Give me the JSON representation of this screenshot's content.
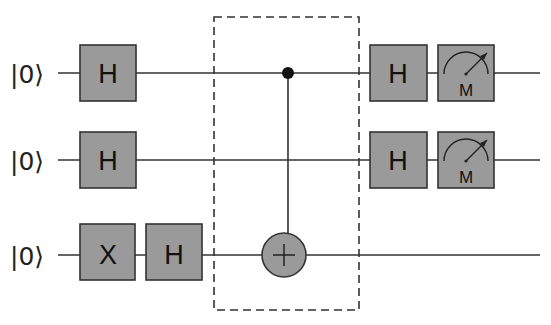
{
  "diagram": {
    "type": "quantum-circuit",
    "colors": {
      "wire": "#333333",
      "gate_fill": "#9a9a9a",
      "gate_stroke": "#333333",
      "dashed_box": "#333333",
      "control_dot": "#111111"
    },
    "qubits": [
      {
        "label": "|0⟩",
        "wire_y": 73
      },
      {
        "label": "|0⟩",
        "wire_y": 160
      },
      {
        "label": "|0⟩",
        "wire_y": 255
      }
    ],
    "gates": [
      {
        "qubit": 0,
        "label": "H",
        "type": "hadamard",
        "position": "pre"
      },
      {
        "qubit": 1,
        "label": "H",
        "type": "hadamard",
        "position": "pre"
      },
      {
        "qubit": 2,
        "label": "X",
        "type": "pauli-x",
        "position": "pre"
      },
      {
        "qubit": 2,
        "label": "H",
        "type": "hadamard",
        "position": "pre"
      },
      {
        "qubit": 0,
        "label": "H",
        "type": "hadamard",
        "position": "post"
      },
      {
        "qubit": 1,
        "label": "H",
        "type": "hadamard",
        "position": "post"
      },
      {
        "qubit": 0,
        "label": "M",
        "type": "measurement",
        "position": "post"
      },
      {
        "qubit": 1,
        "label": "M",
        "type": "measurement",
        "position": "post"
      }
    ],
    "cnot": {
      "control": 0,
      "target": 2,
      "symbol": "+"
    },
    "oracle_box": {
      "style": "dashed"
    }
  }
}
